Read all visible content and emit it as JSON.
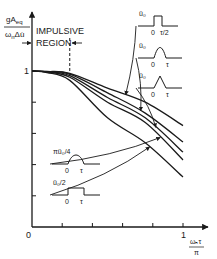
{
  "chart_data": {
    "type": "line",
    "title": "",
    "ylabel_numerator": "gA",
    "ylabel_numerator_sub": "eq",
    "ylabel_denominator": "ω",
    "ylabel_denominator_sub": "n",
    "ylabel_denominator_tail": "Δu̇",
    "xlabel_numerator": "ωₙτ",
    "xlabel_denominator": "π",
    "xlim": [
      0,
      1.1
    ],
    "ylim": [
      0,
      1.15
    ],
    "x_ticks": [
      0.2,
      0.4,
      0.6,
      0.8,
      1.0
    ],
    "y_ticks": [
      0.2,
      0.4,
      0.6,
      0.8,
      1.0
    ],
    "x_tick_labels": {
      "origin": "0",
      "one": "1"
    },
    "y_tick_labels": {
      "one": "1"
    },
    "grid": false,
    "annotation": {
      "text_line1": "IMPULSIVE",
      "text_line2": "REGION",
      "boundary_x": 0.25
    },
    "x": [
      0,
      0.1,
      0.25,
      0.5,
      0.75,
      1.0
    ],
    "series": [
      {
        "name": "rectangular ü0, duration τ/2",
        "pulse": "rect-half",
        "amp_label": "ü₀",
        "t_label": "τ/2",
        "values": [
          1.0,
          0.997,
          0.985,
          0.89,
          0.8,
          0.65
        ]
      },
      {
        "name": "half-sine ü0",
        "pulse": "half-sine",
        "amp_label": "ü₀",
        "t_label": "τ",
        "values": [
          1.0,
          0.996,
          0.98,
          0.86,
          0.73,
          0.545
        ]
      },
      {
        "name": "triangular ü0",
        "pulse": "triangle",
        "amp_label": "ü₀",
        "t_label": "τ",
        "values": [
          1.0,
          0.995,
          0.97,
          0.83,
          0.7,
          0.48
        ]
      },
      {
        "name": "half-sine πü0/4",
        "pulse": "half-sine-low",
        "amp_label": "πü₀/4",
        "t_label": "τ",
        "values": [
          1.0,
          0.994,
          0.96,
          0.8,
          0.67,
          0.43
        ]
      },
      {
        "name": "rectangular ü0/2",
        "pulse": "rect-full",
        "amp_label": "ü₀/2",
        "t_label": "τ",
        "values": [
          1.0,
          0.99,
          0.94,
          0.7,
          0.54,
          0.32
        ]
      }
    ],
    "inset_zero_label": "0"
  }
}
